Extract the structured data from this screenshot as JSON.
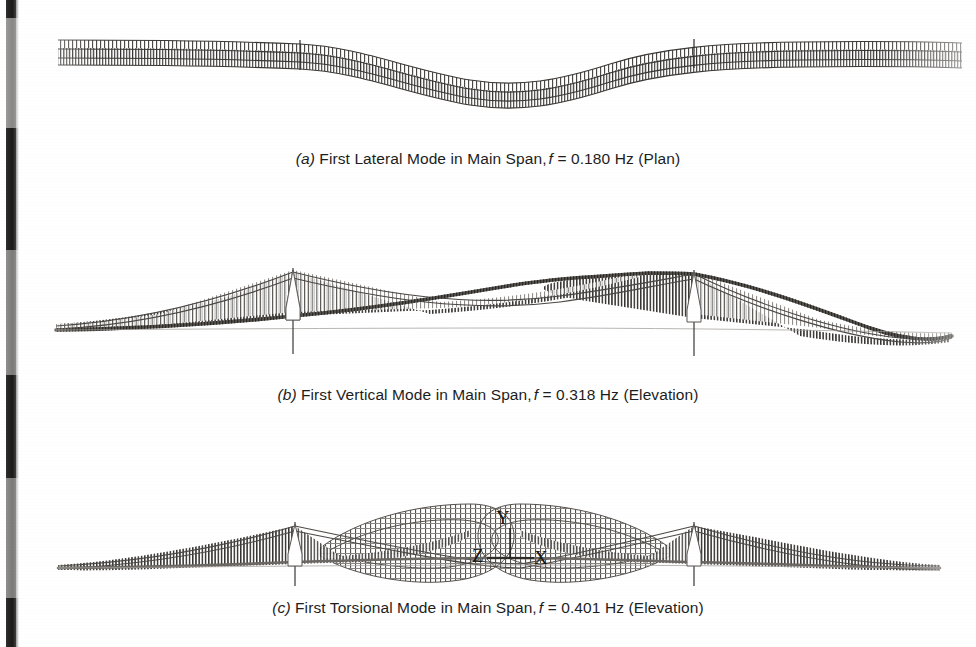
{
  "figure": {
    "kind": "bridge-mode-shape-figure",
    "background_color": "#ffffff",
    "ink_color": "#1d1d1d",
    "panels": [
      {
        "id": "a",
        "label": "(a)",
        "label_letter": "a",
        "caption_text": "First Lateral Mode in Main Span,",
        "freq_symbol": "f",
        "freq_equals": "= 0.180 Hz",
        "view": "(Plan)",
        "caption_full": "(a) First Lateral Mode in Main Span, f = 0.180 Hz (Plan)",
        "mode_type": "lateral",
        "frequency_hz": 0.18,
        "view_name": "Plan",
        "span_name": "Main Span"
      },
      {
        "id": "b",
        "label": "(b)",
        "label_letter": "b",
        "caption_text": "First Vertical Mode in Main Span,",
        "freq_symbol": "f",
        "freq_equals": "= 0.318 Hz",
        "view": "(Elevation)",
        "caption_full": "(b) First Vertical Mode in Main Span, f = 0.318 Hz (Elevation)",
        "mode_type": "vertical",
        "frequency_hz": 0.318,
        "view_name": "Elevation",
        "span_name": "Main Span"
      },
      {
        "id": "c",
        "label": "(c)",
        "label_letter": "c",
        "caption_text": "First Torsional Mode in Main Span,",
        "freq_symbol": "f",
        "freq_equals": "= 0.401 Hz",
        "view": "(Elevation)",
        "caption_full": "(c) First Torsional Mode in Main Span, f = 0.401 Hz (Elevation)",
        "mode_type": "torsional",
        "frequency_hz": 0.401,
        "view_name": "Elevation",
        "span_name": "Main Span"
      }
    ],
    "axis_triad": {
      "y_label": "Y",
      "z_label": "Z",
      "x_label": "X"
    }
  }
}
